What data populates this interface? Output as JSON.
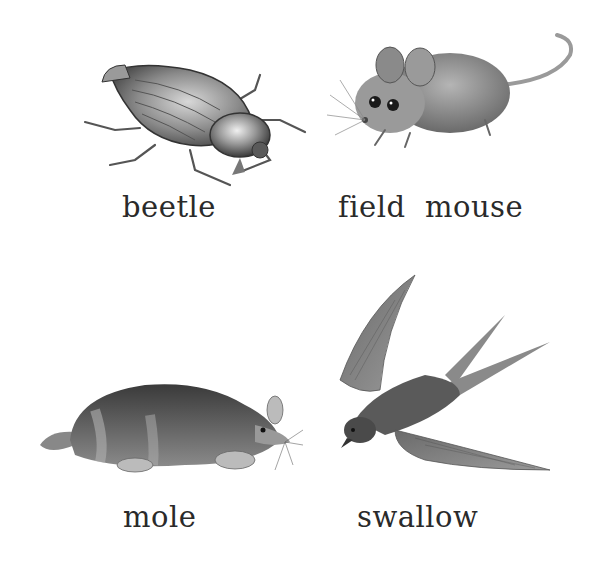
{
  "animals": [
    {
      "id": "beetle",
      "label": "beetle"
    },
    {
      "id": "field-mouse",
      "label": "field  mouse"
    },
    {
      "id": "mole",
      "label": "mole"
    },
    {
      "id": "swallow",
      "label": "swallow"
    }
  ],
  "colors": {
    "background": "#ffffff",
    "text": "#2a2a2a",
    "sketch_dark": "#3a3a3a",
    "sketch_mid": "#7a7a7a",
    "sketch_light": "#b8b8b8"
  }
}
